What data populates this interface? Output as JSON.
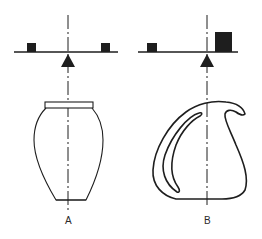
{
  "figure": {
    "panels": [
      {
        "id": "A",
        "label": "A",
        "description": "Symmetric vase with balanced beam; equal weights on both sides of the central axis",
        "balance": {
          "left_weight": "small",
          "right_weight": "small",
          "state": "balanced"
        }
      },
      {
        "id": "B",
        "label": "B",
        "description": "Asymmetric pitcher with handle; small weight left, large weight right near axis",
        "balance": {
          "left_weight": "small",
          "right_weight": "large",
          "state": "balanced-asymmetric"
        }
      }
    ],
    "colors": {
      "ink": "#1e1e1e",
      "background": "#ffffff"
    }
  }
}
